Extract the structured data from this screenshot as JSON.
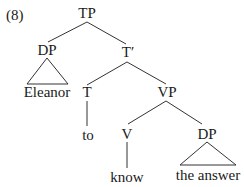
{
  "example_number": "(8)",
  "tree": {
    "root": {
      "label": "TP",
      "children": [
        {
          "label": "DP",
          "triangle": true,
          "terminal": "Eleanor"
        },
        {
          "label": "T′",
          "children": [
            {
              "label": "T",
              "terminal": "to"
            },
            {
              "label": "VP",
              "children": [
                {
                  "label": "V",
                  "terminal": "know"
                },
                {
                  "label": "DP",
                  "triangle": true,
                  "terminal": "the answer"
                }
              ]
            }
          ]
        }
      ]
    }
  },
  "nodes": {
    "tp": "TP",
    "dp_subject": "DP",
    "eleanor": "Eleanor",
    "t_bar": "T′",
    "t": "T",
    "to": "to",
    "vp": "VP",
    "v": "V",
    "know": "know",
    "dp_object": "DP",
    "the_answer": "the answer"
  },
  "colors": {
    "ink": "#1a1a1a",
    "lines": "#333333",
    "background": "#ffffff"
  }
}
